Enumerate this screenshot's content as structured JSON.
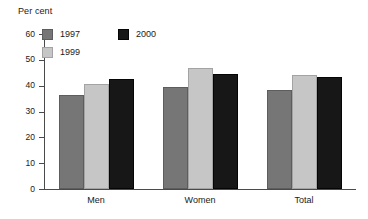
{
  "chart_data": {
    "type": "bar",
    "title": "",
    "subtitle": "",
    "xlabel": "",
    "ylabel": "Per cent",
    "ylim": [
      0,
      60
    ],
    "yticks": [
      0,
      10,
      20,
      30,
      40,
      50,
      60
    ],
    "ytick_labels": [
      "0",
      "10",
      "20",
      "30",
      "40",
      "50",
      "60"
    ],
    "grid": false,
    "legend_position": "top-left inside plot",
    "categories": [
      "Men",
      "Women",
      "Total"
    ],
    "series": [
      {
        "name": "1997",
        "color": "#767676",
        "values": [
          36.5,
          39.5,
          38.5
        ]
      },
      {
        "name": "1999",
        "color": "#c6c6c6",
        "values": [
          40.5,
          47.0,
          44.0
        ]
      },
      {
        "name": "2000",
        "color": "#171717",
        "values": [
          42.5,
          44.5,
          43.5
        ]
      }
    ]
  },
  "axis": {
    "y_title": "Per cent"
  },
  "legend": {
    "items": [
      {
        "label": "1997"
      },
      {
        "label": "1999"
      },
      {
        "label": "2000"
      }
    ]
  }
}
